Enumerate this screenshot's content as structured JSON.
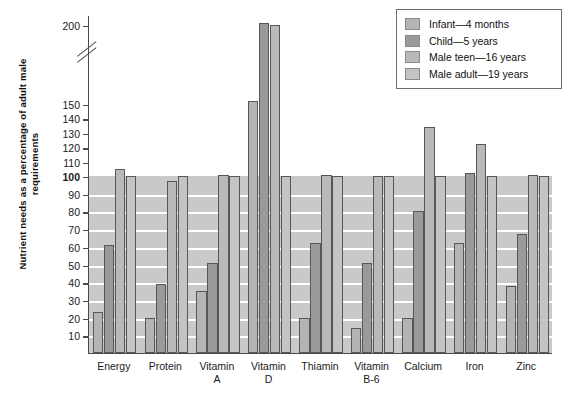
{
  "chart_data": {
    "type": "bar",
    "title": "",
    "xlabel": "",
    "ylabel": "Nutrient needs as a percentage of adult male requirements",
    "categories": [
      "Energy",
      "Protein",
      "Vitamin A",
      "Vitamin D",
      "Thiamin",
      "Vitamin B-6",
      "Calcium",
      "Iron",
      "Zinc"
    ],
    "category_lines": [
      [
        "Energy"
      ],
      [
        "Protein"
      ],
      [
        "Vitamin",
        "A"
      ],
      [
        "Vitamin",
        "D"
      ],
      [
        "Thiamin"
      ],
      [
        "Vitamin",
        "B-6"
      ],
      [
        "Calcium"
      ],
      [
        "Iron"
      ],
      [
        "Zinc"
      ]
    ],
    "series": [
      {
        "name": "Infant—4 months",
        "color": "#b4b4b4",
        "values": [
          23,
          20,
          35,
          152,
          20,
          14,
          20,
          62,
          38
        ]
      },
      {
        "name": "Child—5 years",
        "color": "#9a9a9a",
        "values": [
          61,
          39,
          51,
          201,
          62,
          51,
          80,
          102,
          67
        ]
      },
      {
        "name": "Male teen—16 years",
        "color": "#b9b9b9",
        "values": [
          105,
          97,
          101,
          200,
          101,
          100,
          134,
          122,
          101
        ]
      },
      {
        "name": "Male adult—19 years",
        "color": "#c4c4c4",
        "values": [
          100,
          100,
          100,
          100,
          100,
          100,
          100,
          100,
          100
        ]
      }
    ],
    "ytick_labels": [
      "10",
      "20",
      "30",
      "40",
      "50",
      "60",
      "70",
      "80",
      "90",
      "100",
      "110",
      "120",
      "130",
      "140",
      "150",
      "200"
    ],
    "ytick_values": [
      10,
      20,
      30,
      40,
      50,
      60,
      70,
      80,
      90,
      100,
      110,
      120,
      130,
      140,
      150,
      200
    ],
    "ylim": [
      0,
      200
    ],
    "axis_break": true,
    "axis_break_between": [
      150,
      200
    ],
    "bold_ytick": "100",
    "grid": true,
    "grid_color": "#ffffff",
    "shaded_band_to": 100,
    "shaded_band_color": "#c9c9c9",
    "legend_position": "top-right"
  },
  "legend": {
    "items": [
      {
        "label": "Infant—4 months",
        "swatch": "#b4b4b4"
      },
      {
        "label": "Child—5 years",
        "swatch": "#9a9a9a"
      },
      {
        "label": "Male teen—16 years",
        "swatch": "#b9b9b9"
      },
      {
        "label": "Male adult—19 years",
        "swatch": "#c4c4c4"
      }
    ]
  }
}
